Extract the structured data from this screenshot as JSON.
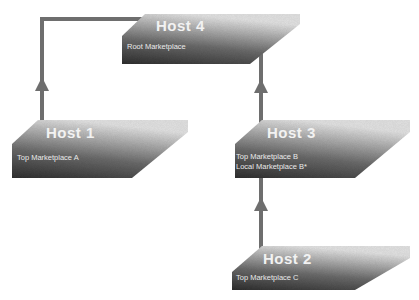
{
  "diagram": {
    "type": "marketplace-hierarchy",
    "colors": {
      "platform_dark": "#3a3a3a",
      "platform_light": "#d6d6d6",
      "connector": "#6e6e6e",
      "text": "#f0f0f0"
    },
    "hosts": [
      {
        "id": "host4",
        "title": "Host 4",
        "lines": [
          "Root Marketplace"
        ]
      },
      {
        "id": "host1",
        "title": "Host 1",
        "lines": [
          "Top Marketplace A"
        ]
      },
      {
        "id": "host3",
        "title": "Host 3",
        "lines": [
          "Top Marketplace B",
          "Local Marketplace B*"
        ]
      },
      {
        "id": "host2",
        "title": "Host 2",
        "lines": [
          "Top Marketplace C"
        ]
      }
    ],
    "connections": [
      {
        "from": "Host 1",
        "to": "Host 4",
        "direction": "up"
      },
      {
        "from": "Host 3",
        "to": "Host 4",
        "direction": "up"
      },
      {
        "from": "Host 2",
        "to": "Host 3",
        "direction": "up"
      }
    ]
  }
}
